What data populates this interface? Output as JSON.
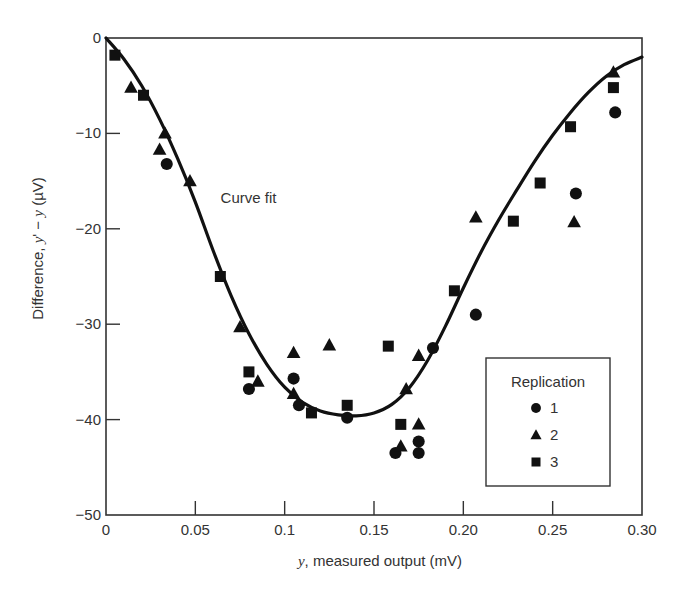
{
  "chart_data": {
    "type": "scatter",
    "title": "",
    "xlabel_var": "y",
    "xlabel_rest": ", measured output (mV)",
    "ylabel_prefix": "Difference, ",
    "ylabel_var1": "y",
    "ylabel_mid": "' − ",
    "ylabel_var2": "y",
    "ylabel_suffix": " (µV)",
    "xlim": [
      0,
      0.3
    ],
    "ylim": [
      -50,
      0
    ],
    "x_ticks": [
      0,
      0.05,
      0.1,
      0.15,
      0.2,
      0.25,
      0.3
    ],
    "x_tick_labels": [
      "0",
      "0.05",
      "0.1",
      "0.15",
      "0.20",
      "0.25",
      "0.30"
    ],
    "y_ticks": [
      0,
      -10,
      -20,
      -30,
      -40,
      -50
    ],
    "y_tick_labels": [
      "0",
      "−10",
      "−20",
      "−30",
      "−40",
      "−50"
    ],
    "grid": false,
    "annotation": {
      "text": "Curve fit",
      "x": 0.063,
      "y": -17.3
    },
    "legend": {
      "title": "Replication",
      "position": "lower right",
      "entries": [
        {
          "label": "1",
          "marker": "circle"
        },
        {
          "label": "2",
          "marker": "triangle"
        },
        {
          "label": "3",
          "marker": "square"
        }
      ]
    },
    "series": [
      {
        "name": "1",
        "marker": "circle",
        "points": [
          [
            0.034,
            -13.2
          ],
          [
            0.08,
            -36.8
          ],
          [
            0.105,
            -35.7
          ],
          [
            0.108,
            -38.5
          ],
          [
            0.135,
            -39.8
          ],
          [
            0.162,
            -43.5
          ],
          [
            0.175,
            -42.3
          ],
          [
            0.175,
            -43.5
          ],
          [
            0.183,
            -32.5
          ],
          [
            0.207,
            -29.0
          ],
          [
            0.263,
            -16.3
          ],
          [
            0.285,
            -7.8
          ]
        ]
      },
      {
        "name": "2",
        "marker": "triangle",
        "points": [
          [
            0.014,
            -5.2
          ],
          [
            0.03,
            -11.7
          ],
          [
            0.033,
            -10.0
          ],
          [
            0.047,
            -15.0
          ],
          [
            0.075,
            -30.3
          ],
          [
            0.085,
            -36.0
          ],
          [
            0.105,
            -33.0
          ],
          [
            0.105,
            -37.3
          ],
          [
            0.125,
            -32.2
          ],
          [
            0.165,
            -42.8
          ],
          [
            0.168,
            -36.8
          ],
          [
            0.175,
            -40.5
          ],
          [
            0.175,
            -33.3
          ],
          [
            0.207,
            -18.8
          ],
          [
            0.262,
            -19.3
          ],
          [
            0.284,
            -3.6
          ]
        ]
      },
      {
        "name": "3",
        "marker": "square",
        "points": [
          [
            0.005,
            -1.8
          ],
          [
            0.021,
            -6.0
          ],
          [
            0.064,
            -25.0
          ],
          [
            0.08,
            -35.0
          ],
          [
            0.115,
            -39.3
          ],
          [
            0.135,
            -38.5
          ],
          [
            0.158,
            -32.3
          ],
          [
            0.165,
            -40.5
          ],
          [
            0.195,
            -26.5
          ],
          [
            0.228,
            -19.2
          ],
          [
            0.243,
            -15.2
          ],
          [
            0.26,
            -9.3
          ],
          [
            0.284,
            -5.2
          ]
        ]
      },
      {
        "name": "Curve fit",
        "type": "line",
        "points": [
          [
            0.0,
            0.0
          ],
          [
            0.01,
            -2.2
          ],
          [
            0.02,
            -5.0
          ],
          [
            0.03,
            -8.5
          ],
          [
            0.04,
            -12.6
          ],
          [
            0.05,
            -17.2
          ],
          [
            0.06,
            -22.3
          ],
          [
            0.07,
            -27.0
          ],
          [
            0.08,
            -31.0
          ],
          [
            0.09,
            -34.2
          ],
          [
            0.1,
            -36.6
          ],
          [
            0.11,
            -38.2
          ],
          [
            0.12,
            -39.1
          ],
          [
            0.13,
            -39.5
          ],
          [
            0.14,
            -39.6
          ],
          [
            0.15,
            -39.3
          ],
          [
            0.16,
            -38.4
          ],
          [
            0.17,
            -36.6
          ],
          [
            0.18,
            -33.8
          ],
          [
            0.19,
            -30.2
          ],
          [
            0.2,
            -26.2
          ],
          [
            0.21,
            -22.4
          ],
          [
            0.22,
            -19.0
          ],
          [
            0.23,
            -15.9
          ],
          [
            0.24,
            -12.9
          ],
          [
            0.25,
            -10.2
          ],
          [
            0.26,
            -7.8
          ],
          [
            0.27,
            -5.7
          ],
          [
            0.28,
            -4.0
          ],
          [
            0.29,
            -2.8
          ],
          [
            0.3,
            -2.0
          ]
        ]
      }
    ]
  }
}
